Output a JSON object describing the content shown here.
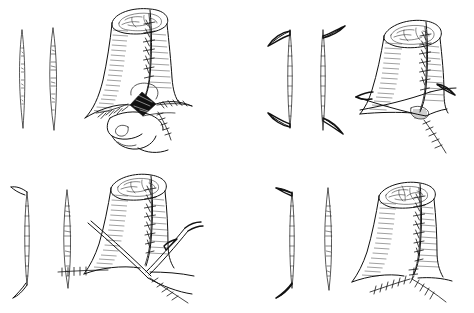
{
  "figure": {
    "title": "Surgical reconstruction technique, four-stage line illustration",
    "medium": "pen-and-ink line drawing",
    "background_color": "#ffffff",
    "ink_color": "#111111",
    "shading_color": "#2a2a2a",
    "defect_fill_color": "#101010",
    "layout": "2 x 2 grid of unlabeled panels, no captions or text",
    "width": 474,
    "height": 313,
    "text_present": "none"
  },
  "panels": [
    {
      "id": "panel-top-left",
      "position": "top-left",
      "stage_number": "1",
      "description": "Tubular structure with anterior vertical suture line and a dark triangular defect at the base; fingers retract the surrounding tissue.",
      "diagrams": [
        {
          "name": "incision-pattern-a",
          "shape": "straight vertical spindle",
          "detail": "narrow lens / ellipse outline, tapered at both ends"
        },
        {
          "name": "incision-pattern-b",
          "shape": "straight vertical spindle",
          "detail": "narrow lens / ellipse outline, tapered at both ends"
        }
      ],
      "anatomy": {
        "name": "tubular-conduit",
        "lumen": "open stippled rim at top",
        "suture_line": "vertical interrupted sutures on anterior wall",
        "defect": "dark triangular raw area at base",
        "instrument": "retracting fingers",
        "base_sutures": "horizontal interrupted row left and right of defect"
      }
    },
    {
      "id": "panel-top-right",
      "position": "top-right",
      "stage_number": "2",
      "description": "Tube after Z-plasty flaps are raised; transposition flaps held by traction sutures crossing at the base, vertical suture line closed.",
      "diagrams": [
        {
          "name": "incision-pattern-a",
          "shape": "vertical line with opposed angled limbs (Z-plasty)",
          "detail": "limb angled up-left at top, down-left at bottom"
        },
        {
          "name": "incision-pattern-b",
          "shape": "vertical line with opposed angled limbs (Z-plasty)",
          "detail": "limb angled up-right at top, down-right at bottom"
        }
      ],
      "anatomy": {
        "name": "tubular-conduit",
        "lumen": "open stippled rim at top",
        "suture_line": "vertical interrupted sutures on anterior wall",
        "defect": "small stippled raw area at base",
        "instrument": "crossed traction threads with needles",
        "base_sutures": "oblique interrupted suture line running down-right"
      }
    },
    {
      "id": "panel-bottom-left",
      "position": "bottom-left",
      "stage_number": "3",
      "description": "Flaps transposed and being drawn into the base; traction threads pull the flap tips toward the midline, interrupted sutures approximate the edges.",
      "diagrams": [
        {
          "name": "incision-pattern-a",
          "shape": "bracket form with angled end limbs",
          "detail": "vertical line with short limbs turning left at top and bottom"
        },
        {
          "name": "incision-pattern-b",
          "shape": "straight vertical spindle",
          "detail": "narrow lens / ellipse outline, tapered at both ends"
        }
      ],
      "anatomy": {
        "name": "tubular-conduit",
        "lumen": "open stippled rim at top",
        "suture_line": "vertical interrupted sutures on anterior wall",
        "defect": "closed, converging at midline",
        "instrument": "two crossing traction threads with needles",
        "base_sutures": "interrupted rows to the left and descending to lower right"
      }
    },
    {
      "id": "panel-bottom-right",
      "position": "bottom-right",
      "stage_number": "4",
      "description": "Completed repair: vertical suture line on the tube continuing into a Y-shaped interrupted closure at the base, no instruments present.",
      "diagrams": [
        {
          "name": "incision-pattern-a",
          "shape": "vertical line with opposed angled limbs",
          "detail": "short limb angled up-left at top, curved limb at bottom"
        },
        {
          "name": "incision-pattern-b",
          "shape": "straight vertical spindle",
          "detail": "narrow lens / ellipse outline, tapered at both ends"
        }
      ],
      "anatomy": {
        "name": "tubular-conduit",
        "lumen": "closed stippled rosette at top",
        "suture_line": "vertical interrupted sutures on anterior wall",
        "defect": "fully closed",
        "instrument": "none",
        "base_sutures": "Y-shaped interrupted suture lines branching left and right"
      }
    }
  ]
}
